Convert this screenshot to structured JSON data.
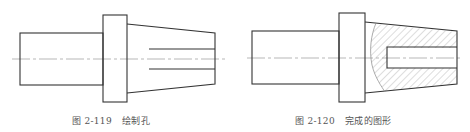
{
  "figures": [
    {
      "id": "fig-2-119",
      "caption_number": "图 2-119",
      "caption_title": "绘制孔",
      "description": "Stepped shaft part with flange and tapered end, hole drawn as two parallel lines"
    },
    {
      "id": "fig-2-120",
      "caption_number": "图 2-120",
      "caption_title": "完成的图形",
      "description": "Completed figure with local section: hatched area and break line showing the hole"
    }
  ],
  "colors": {
    "outline": "#333333",
    "centerline": "#999999",
    "hatch": "#aaaaaa",
    "caption": "#555555"
  }
}
